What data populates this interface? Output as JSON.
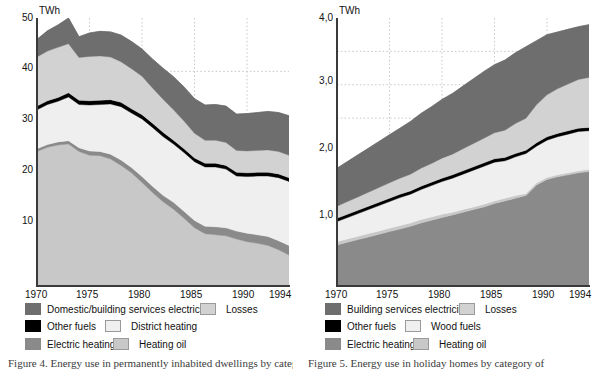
{
  "figure": {
    "panels": [
      {
        "id": "left",
        "unit": "TWh",
        "y_ticks": [
          "50",
          "40",
          "30",
          "20",
          "10"
        ],
        "x_ticks": [
          "1970",
          "1975",
          "1980",
          "1985",
          "1990",
          "1994"
        ],
        "caption": "Figure 4. Energy use in permanently inhabited dwellings by category of",
        "legend": [
          {
            "label": "Domestic/building services electricity",
            "color": "#6e6e6e",
            "bordered": false
          },
          {
            "label": "Losses",
            "color": "#d2d2d2",
            "bordered": true
          },
          {
            "label": "Other fuels",
            "color": "#000000",
            "bordered": false
          },
          {
            "label": "District heating",
            "color": "#efefef",
            "bordered": true
          },
          {
            "label": "Electric heating",
            "color": "#8a8a8a",
            "bordered": false
          },
          {
            "label": "Heating oil",
            "color": "#c8c8c8",
            "bordered": true
          }
        ]
      },
      {
        "id": "right",
        "unit": "TWh",
        "y_ticks": [
          "4,0",
          "3,0",
          "2,0",
          "1,0"
        ],
        "x_ticks": [
          "1970",
          "1975",
          "1980",
          "1985",
          "1990",
          "1994"
        ],
        "caption": "Figure 5. Energy use in holiday homes by category of",
        "legend": [
          {
            "label": "Building services electricity",
            "color": "#6e6e6e",
            "bordered": false
          },
          {
            "label": "Losses",
            "color": "#d2d2d2",
            "bordered": true
          },
          {
            "label": "Other fuels",
            "color": "#000000",
            "bordered": false
          },
          {
            "label": "Wood fuels",
            "color": "#efefef",
            "bordered": true
          },
          {
            "label": "Electric heating",
            "color": "#8a8a8a",
            "bordered": false
          },
          {
            "label": "Heating oil",
            "color": "#c8c8c8",
            "bordered": true
          }
        ]
      }
    ]
  },
  "chart_data": [
    {
      "type": "area",
      "id": "dwellings-energy-use",
      "title": "Energy use in permanently inhabited dwellings",
      "xlabel": "",
      "ylabel": "TWh",
      "unit": "TWh",
      "stacked": true,
      "grid": true,
      "grid_x_values": [
        1975,
        1980,
        1985,
        1990
      ],
      "grid_y_values": [
        40
      ],
      "legend_position": "below",
      "xlim": [
        1970,
        1994
      ],
      "ylim": [
        0,
        50
      ],
      "x": [
        1970,
        1971,
        1972,
        1973,
        1974,
        1975,
        1976,
        1977,
        1978,
        1979,
        1980,
        1981,
        1982,
        1983,
        1984,
        1985,
        1986,
        1987,
        1988,
        1989,
        1990,
        1991,
        1992,
        1993,
        1994
      ],
      "series": [
        {
          "name": "Heating oil",
          "color": "#c8c8c8",
          "values": [
            25.0,
            25.8,
            26.2,
            26.4,
            25.0,
            24.3,
            24.2,
            23.6,
            22.4,
            21.0,
            19.2,
            17.3,
            15.6,
            14.2,
            12.5,
            10.7,
            9.6,
            9.4,
            9.2,
            8.6,
            8.1,
            7.8,
            7.4,
            6.6,
            5.6
          ]
        },
        {
          "name": "Electric heating",
          "color": "#8a8a8a",
          "values": [
            0.5,
            0.5,
            0.6,
            0.6,
            0.7,
            0.8,
            0.8,
            0.9,
            1.0,
            1.0,
            1.1,
            1.2,
            1.2,
            1.3,
            1.3,
            1.4,
            1.4,
            1.5,
            1.5,
            1.5,
            1.6,
            1.6,
            1.7,
            1.7,
            1.8
          ]
        },
        {
          "name": "District heating",
          "color": "#efefef",
          "values": [
            7.3,
            7.5,
            7.6,
            8.2,
            8.1,
            8.6,
            8.8,
            9.4,
            10.0,
            10.2,
            10.8,
            11.0,
            11.0,
            10.9,
            11.0,
            11.0,
            11.1,
            11.2,
            11.0,
            10.3,
            10.6,
            11.0,
            11.3,
            11.8,
            12.0
          ]
        },
        {
          "name": "Other fuels",
          "color": "#000000",
          "values": [
            0.7,
            0.7,
            0.7,
            0.8,
            0.8,
            0.8,
            0.8,
            0.8,
            0.8,
            0.8,
            0.8,
            0.8,
            0.8,
            0.7,
            0.7,
            0.7,
            0.7,
            0.7,
            0.7,
            0.7,
            0.7,
            0.7,
            0.7,
            0.7,
            0.7
          ]
        },
        {
          "name": "Losses",
          "color": "#d2d2d2",
          "values": [
            9.2,
            9.3,
            9.4,
            9.2,
            8.0,
            8.3,
            8.3,
            8.0,
            7.6,
            7.5,
            7.2,
            6.6,
            6.2,
            5.7,
            5.2,
            4.6,
            4.3,
            4.3,
            4.3,
            4.1,
            4.1,
            4.1,
            4.2,
            4.2,
            4.2
          ]
        },
        {
          "name": "Domestic/building services electricity",
          "color": "#6e6e6e",
          "values": [
            3.3,
            3.8,
            4.2,
            4.8,
            3.9,
            4.4,
            4.6,
            4.7,
            5.0,
            5.1,
            5.1,
            5.4,
            5.8,
            6.2,
            6.4,
            6.5,
            6.6,
            6.7,
            6.8,
            6.8,
            7.0,
            7.1,
            7.2,
            7.3,
            7.4
          ]
        }
      ],
      "total_values": [
        46.0,
        47.6,
        48.7,
        50.0,
        46.5,
        47.2,
        47.5,
        47.4,
        46.8,
        45.6,
        44.2,
        42.3,
        40.6,
        39.0,
        37.1,
        34.9,
        33.7,
        33.8,
        33.5,
        32.0,
        32.1,
        32.3,
        32.5,
        32.3,
        31.7
      ],
      "notes": "Thick black line = Other fuels band, running from about 33 TWh in 1970 down to about 27 TWh by 1994."
    },
    {
      "type": "area",
      "id": "holiday-homes-energy-use",
      "title": "Energy use in holiday homes",
      "xlabel": "",
      "ylabel": "TWh",
      "unit": "TWh",
      "stacked": true,
      "grid": true,
      "grid_x_values": [
        1975,
        1980,
        1985,
        1990
      ],
      "grid_y_values": [
        2.5,
        3.0,
        3.5
      ],
      "legend_position": "below",
      "xlim": [
        1970,
        1994
      ],
      "ylim": [
        0,
        4.0
      ],
      "x": [
        1970,
        1971,
        1972,
        1973,
        1974,
        1975,
        1976,
        1977,
        1978,
        1979,
        1980,
        1981,
        1982,
        1983,
        1984,
        1985,
        1986,
        1987,
        1988,
        1989,
        1990,
        1991,
        1992,
        1993,
        1994
      ],
      "series": [
        {
          "name": "Electric heating",
          "color": "#8a8a8a",
          "values": [
            0.6,
            0.64,
            0.68,
            0.72,
            0.76,
            0.8,
            0.84,
            0.88,
            0.93,
            0.97,
            1.01,
            1.05,
            1.09,
            1.13,
            1.17,
            1.22,
            1.26,
            1.3,
            1.34,
            1.5,
            1.58,
            1.62,
            1.65,
            1.68,
            1.7
          ]
        },
        {
          "name": "Heating oil",
          "color": "#c8c8c8",
          "values": [
            0.05,
            0.05,
            0.05,
            0.05,
            0.05,
            0.05,
            0.05,
            0.05,
            0.05,
            0.05,
            0.05,
            0.04,
            0.04,
            0.04,
            0.04,
            0.04,
            0.04,
            0.04,
            0.03,
            0.03,
            0.03,
            0.03,
            0.03,
            0.03,
            0.03
          ]
        },
        {
          "name": "Wood fuels",
          "color": "#efefef",
          "values": [
            0.3,
            0.32,
            0.34,
            0.36,
            0.38,
            0.4,
            0.42,
            0.43,
            0.45,
            0.47,
            0.49,
            0.51,
            0.53,
            0.55,
            0.57,
            0.58,
            0.56,
            0.58,
            0.6,
            0.55,
            0.56,
            0.57,
            0.58,
            0.59,
            0.58
          ]
        },
        {
          "name": "Other fuels",
          "color": "#000000",
          "values": [
            0.05,
            0.05,
            0.05,
            0.05,
            0.05,
            0.05,
            0.05,
            0.05,
            0.05,
            0.05,
            0.05,
            0.05,
            0.05,
            0.05,
            0.05,
            0.05,
            0.05,
            0.05,
            0.05,
            0.05,
            0.05,
            0.05,
            0.05,
            0.05,
            0.05
          ]
        },
        {
          "name": "Losses",
          "color": "#d2d2d2",
          "values": [
            0.18,
            0.19,
            0.2,
            0.21,
            0.22,
            0.23,
            0.24,
            0.25,
            0.27,
            0.28,
            0.3,
            0.31,
            0.33,
            0.35,
            0.37,
            0.39,
            0.41,
            0.45,
            0.48,
            0.57,
            0.63,
            0.67,
            0.7,
            0.73,
            0.75
          ]
        },
        {
          "name": "Building services electricity",
          "color": "#6e6e6e",
          "values": [
            0.57,
            0.6,
            0.63,
            0.66,
            0.69,
            0.72,
            0.75,
            0.79,
            0.82,
            0.85,
            0.88,
            0.91,
            0.94,
            0.97,
            1.0,
            1.02,
            1.05,
            1.06,
            1.07,
            0.96,
            0.9,
            0.85,
            0.82,
            0.79,
            0.79
          ]
        }
      ],
      "total_values": [
        1.75,
        1.85,
        1.95,
        2.05,
        2.15,
        2.25,
        2.35,
        2.45,
        2.57,
        2.67,
        2.78,
        2.87,
        2.98,
        3.09,
        3.2,
        3.3,
        3.37,
        3.48,
        3.57,
        3.66,
        3.75,
        3.79,
        3.83,
        3.87,
        3.9
      ],
      "notes": "Thick black line = Other fuels band, rising from about 1.0 TWh in 1970 to about 2.35 TWh in 1994."
    }
  ]
}
